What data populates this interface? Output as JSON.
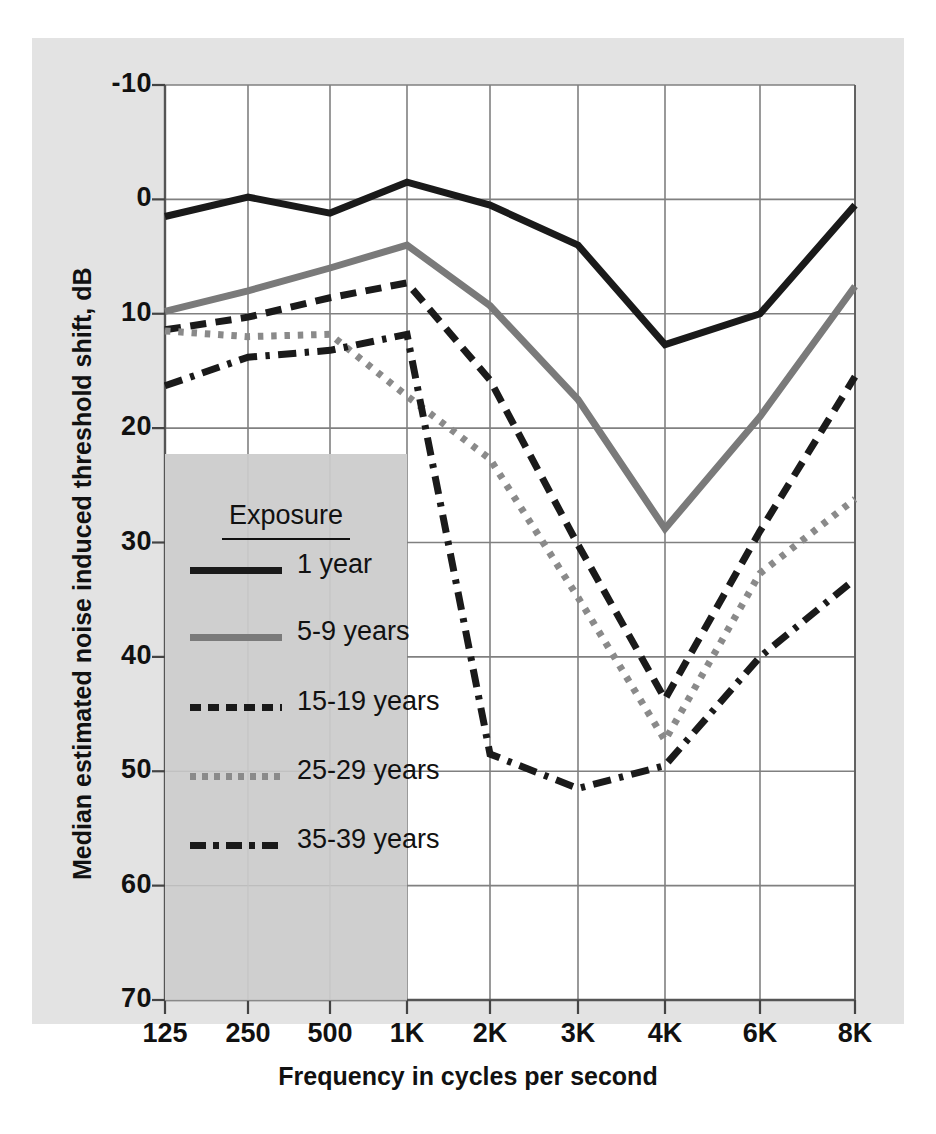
{
  "figure": {
    "background_color": "#e3e3e3",
    "plot_background_color": "#ffffff",
    "legend_background_color": "#cfcfcf",
    "grid_color": "#808080",
    "top_partial_text": "",
    "bottom_partial_text": ""
  },
  "chart_data": {
    "type": "line",
    "title": "",
    "xlabel": "Frequency in cycles per second",
    "ylabel": "Median estimated noise induced threshold shift, dB",
    "categories": [
      "125",
      "250",
      "500",
      "1K",
      "2K",
      "3K",
      "4K",
      "6K",
      "8K"
    ],
    "x_tick_labels": [
      "125",
      "250",
      "500",
      "1K",
      "2K",
      "3K",
      "4K",
      "6K",
      "8K"
    ],
    "y_tick_labels": [
      "-10",
      "0",
      "10",
      "20",
      "30",
      "40",
      "50",
      "60",
      "70"
    ],
    "y_tick_values": [
      -10,
      0,
      10,
      20,
      30,
      40,
      50,
      60,
      70
    ],
    "ylim": [
      -10,
      70
    ],
    "y_axis_inverted": true,
    "grid": true,
    "legend_position": "lower-left-inside",
    "legend_title": "Exposure",
    "series": [
      {
        "name": "1 year",
        "style": "solid",
        "color": "#1a1a1a",
        "width": 7,
        "values": [
          1.5,
          -0.2,
          1.2,
          -1.5,
          0.5,
          4.0,
          12.7,
          10.0,
          0.5
        ]
      },
      {
        "name": "5-9 years",
        "style": "solid",
        "color": "#7a7a7a",
        "width": 7,
        "values": [
          9.8,
          8.0,
          6.0,
          4.0,
          9.3,
          17.5,
          28.8,
          19.0,
          7.6
        ]
      },
      {
        "name": "15-19 years",
        "style": "dashed",
        "color": "#1a1a1a",
        "width": 7,
        "values": [
          11.4,
          10.3,
          8.6,
          7.3,
          15.8,
          30.2,
          43.7,
          29.0,
          15.5
        ]
      },
      {
        "name": "25-29 years",
        "style": "dotted",
        "color": "#8a8a8a",
        "width": 7,
        "values": [
          11.5,
          12.0,
          11.8,
          17.2,
          22.7,
          34.8,
          47.3,
          32.7,
          26.2
        ]
      },
      {
        "name": "35-39 years",
        "style": "dashdot",
        "color": "#1a1a1a",
        "width": 7,
        "values": [
          16.3,
          13.8,
          13.2,
          11.8,
          48.5,
          51.5,
          49.5,
          40.0,
          33.2
        ]
      }
    ]
  },
  "legend": {
    "title": "Exposure",
    "items": [
      {
        "label": "1 year",
        "style": "solid",
        "color": "#1a1a1a"
      },
      {
        "label": "5-9 years",
        "style": "solid",
        "color": "#7a7a7a"
      },
      {
        "label": "15-19 years",
        "style": "dashed",
        "color": "#1a1a1a"
      },
      {
        "label": "25-29 years",
        "style": "dotted",
        "color": "#8a8a8a"
      },
      {
        "label": "35-39 years",
        "style": "dashdot",
        "color": "#1a1a1a"
      }
    ]
  }
}
